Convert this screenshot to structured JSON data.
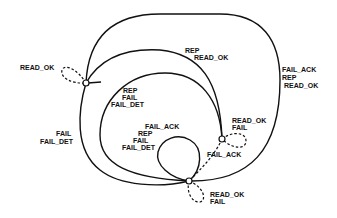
{
  "diagram": {
    "type": "state-transition",
    "states": [
      {
        "id": "s1",
        "name": "state-top-left"
      },
      {
        "id": "s2",
        "name": "state-right"
      },
      {
        "id": "s3",
        "name": "state-bottom"
      }
    ],
    "labels": {
      "s1_self": [
        "READ_OK"
      ],
      "outer_arc": [
        "FAIL_ACK",
        "REP",
        "READ_OK"
      ],
      "middle_arc": [
        "REP",
        "READ_OK"
      ],
      "inner_arc": [
        "REP",
        "FAIL",
        "FAIL_DET"
      ],
      "left_outer": [
        "FAIL",
        "FAIL_DET"
      ],
      "s3_loop": [
        "FAIL_ACK",
        "REP",
        "FAIL",
        "FAIL_DET"
      ],
      "s2_self": [
        "READ_OK",
        "FAIL"
      ],
      "s2_to_s3": [
        "FAIL_ACK"
      ],
      "s3_self": [
        "READ_OK",
        "FAIL"
      ]
    }
  }
}
